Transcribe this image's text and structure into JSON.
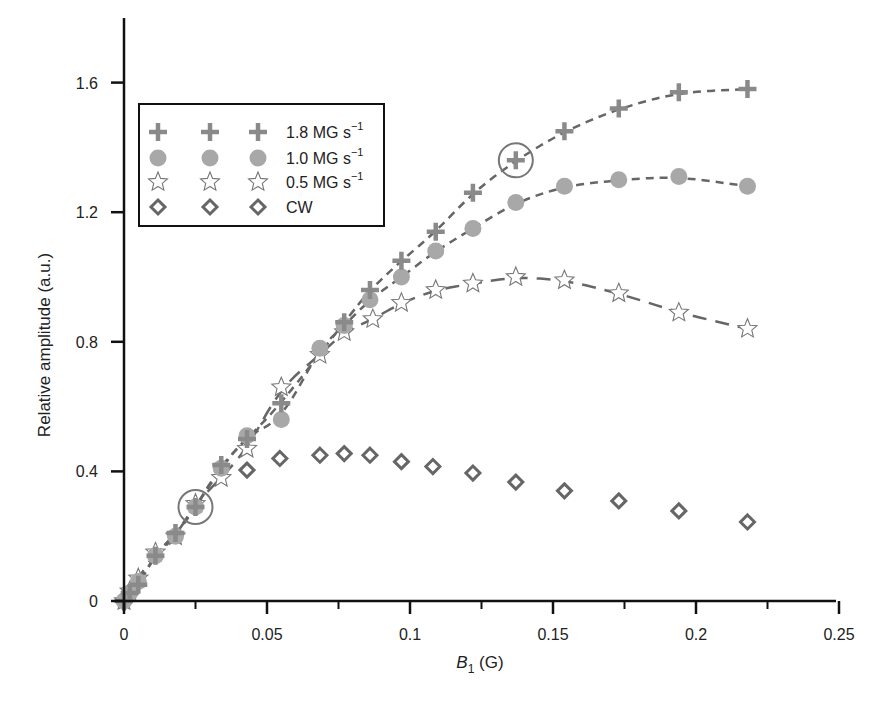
{
  "chart_data": {
    "type": "scatter",
    "title": "",
    "xlabel": "B1 (G)",
    "xlabel_main": "B",
    "xlabel_sub": "1",
    "xlabel_unit": " (G)",
    "ylabel": "Relative amplitude (a.u.)",
    "xlim": [
      0,
      0.25
    ],
    "ylim": [
      0,
      1.8
    ],
    "x_ticks": [
      0,
      0.05,
      0.1,
      0.15,
      0.2,
      0.25
    ],
    "x_tick_labels": [
      "0",
      "0.05",
      "0.1",
      "0.15",
      "0.2",
      "0.25"
    ],
    "x_minor_ticks": [
      0.025,
      0.075,
      0.125,
      0.175,
      0.225
    ],
    "y_ticks": [
      0,
      0.4,
      0.8,
      1.2,
      1.6
    ],
    "y_tick_labels": [
      "0",
      "0.4",
      "0.8",
      "1.2",
      "1.6"
    ],
    "grid": false,
    "legend_position": "upper left",
    "series": [
      {
        "name": "1.8 MG s^-1",
        "label_main": "1.8 MG s",
        "label_sup": "−1",
        "marker": "plus",
        "color": "#8a8a8a",
        "fit": "dashed",
        "x": [
          0,
          0.002,
          0.005,
          0.011,
          0.018,
          0.025,
          0.034,
          0.043,
          0.055,
          0.077,
          0.086,
          0.097,
          0.109,
          0.122,
          0.137,
          0.154,
          0.173,
          0.194,
          0.218
        ],
        "y": [
          0,
          0.025,
          0.05,
          0.14,
          0.21,
          0.29,
          0.42,
          0.5,
          0.61,
          0.86,
          0.96,
          1.05,
          1.14,
          1.26,
          1.36,
          1.45,
          1.52,
          1.57,
          1.58
        ]
      },
      {
        "name": "1.0 MG s^-1",
        "label_main": "1.0 MG s",
        "label_sup": "−1",
        "marker": "circle",
        "color": "#a8a8a8",
        "fit": "dashed",
        "x": [
          0,
          0.002,
          0.005,
          0.011,
          0.018,
          0.025,
          0.034,
          0.043,
          0.055,
          0.0685,
          0.077,
          0.086,
          0.097,
          0.109,
          0.122,
          0.137,
          0.154,
          0.173,
          0.194,
          0.218
        ],
        "y": [
          0,
          0.025,
          0.06,
          0.14,
          0.2,
          0.29,
          0.41,
          0.51,
          0.56,
          0.78,
          0.85,
          0.93,
          1.0,
          1.08,
          1.15,
          1.23,
          1.28,
          1.3,
          1.31,
          1.28
        ]
      },
      {
        "name": "0.5 MG s^-1",
        "label_main": "0.5 MG s",
        "label_sup": "−1",
        "marker": "star",
        "color": "#777777",
        "fit": "long-dashed",
        "x": [
          0,
          0.002,
          0.005,
          0.011,
          0.018,
          0.025,
          0.034,
          0.043,
          0.055,
          0.0685,
          0.077,
          0.087,
          0.097,
          0.109,
          0.122,
          0.137,
          0.154,
          0.173,
          0.194,
          0.218
        ],
        "y": [
          0,
          0.03,
          0.07,
          0.15,
          0.2,
          0.3,
          0.38,
          0.47,
          0.66,
          0.76,
          0.83,
          0.87,
          0.92,
          0.96,
          0.98,
          1.0,
          0.99,
          0.95,
          0.89,
          0.84
        ]
      },
      {
        "name": "CW",
        "label_main": "CW",
        "label_sup": "",
        "marker": "diamond",
        "color": "#666666",
        "fit": "none",
        "x": [
          0,
          0.043,
          0.0545,
          0.0685,
          0.077,
          0.086,
          0.097,
          0.108,
          0.122,
          0.137,
          0.154,
          0.173,
          0.194,
          0.218
        ],
        "y": [
          0,
          0.404,
          0.44,
          0.45,
          0.455,
          0.45,
          0.43,
          0.415,
          0.395,
          0.367,
          0.34,
          0.309,
          0.278,
          0.244
        ]
      }
    ],
    "annotations": [
      {
        "type": "circle",
        "x": 0.025,
        "y": 0.29,
        "note": "highlighted point"
      },
      {
        "type": "circle",
        "x": 0.137,
        "y": 1.36,
        "note": "highlighted point"
      }
    ]
  }
}
